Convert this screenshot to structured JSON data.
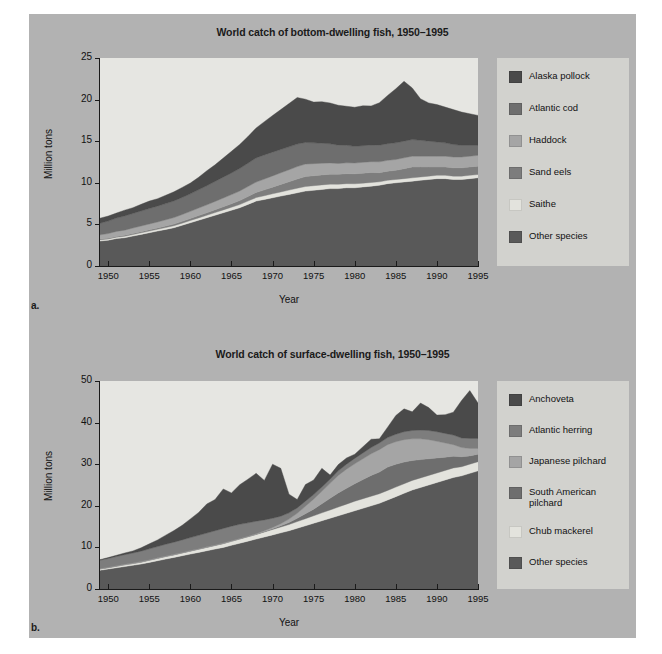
{
  "figure": {
    "background_color": "#b2b2b2",
    "page_color": "#ffffff",
    "plot_background_color": "#e6e6e2",
    "legend_background_color": "#d2d2ce"
  },
  "panels": [
    {
      "letter": "a.",
      "title": "World catch of bottom-dwelling fish, 1950–1995",
      "ylabel": "Million tons",
      "xlabel": "Year"
    },
    {
      "letter": "b.",
      "title": "World catch of surface-dwelling fish, 1950–1995",
      "ylabel": "Million tons",
      "xlabel": "Year"
    }
  ],
  "chart_data": [
    {
      "type": "area",
      "stacked": true,
      "title": "World catch of bottom-dwelling fish, 1950–1995",
      "xlabel": "Year",
      "ylabel": "Million tons",
      "xlim": [
        1949,
        1995
      ],
      "ylim": [
        0,
        25
      ],
      "yticks": [
        0,
        5,
        10,
        15,
        20,
        25
      ],
      "xticks": [
        1950,
        1955,
        1960,
        1965,
        1970,
        1975,
        1980,
        1985,
        1990,
        1995
      ],
      "grid": false,
      "legend_position": "right",
      "x": [
        1949,
        1950,
        1951,
        1952,
        1953,
        1954,
        1955,
        1956,
        1957,
        1958,
        1959,
        1960,
        1961,
        1962,
        1963,
        1964,
        1965,
        1966,
        1967,
        1968,
        1969,
        1970,
        1971,
        1972,
        1973,
        1974,
        1975,
        1976,
        1977,
        1978,
        1979,
        1980,
        1981,
        1982,
        1983,
        1984,
        1985,
        1986,
        1987,
        1988,
        1989,
        1990,
        1991,
        1992,
        1993,
        1994,
        1995
      ],
      "series": [
        {
          "name": "Other species",
          "color": "#595959",
          "values": [
            3.0,
            3.1,
            3.3,
            3.4,
            3.6,
            3.8,
            4.0,
            4.2,
            4.4,
            4.6,
            4.9,
            5.2,
            5.5,
            5.8,
            6.1,
            6.4,
            6.7,
            7.0,
            7.4,
            7.8,
            8.0,
            8.2,
            8.4,
            8.6,
            8.8,
            9.0,
            9.1,
            9.2,
            9.3,
            9.3,
            9.4,
            9.4,
            9.5,
            9.6,
            9.7,
            9.9,
            10.0,
            10.1,
            10.2,
            10.3,
            10.4,
            10.5,
            10.5,
            10.4,
            10.4,
            10.5,
            10.6
          ]
        },
        {
          "name": "Saithe",
          "color": "#e3e3dd",
          "values": [
            0.15,
            0.15,
            0.16,
            0.17,
            0.18,
            0.19,
            0.2,
            0.21,
            0.22,
            0.24,
            0.25,
            0.27,
            0.28,
            0.3,
            0.32,
            0.34,
            0.36,
            0.38,
            0.4,
            0.42,
            0.45,
            0.48,
            0.5,
            0.52,
            0.55,
            0.55,
            0.55,
            0.55,
            0.54,
            0.52,
            0.5,
            0.48,
            0.46,
            0.44,
            0.42,
            0.4,
            0.4,
            0.4,
            0.4,
            0.4,
            0.4,
            0.4,
            0.4,
            0.4,
            0.4,
            0.4,
            0.4
          ]
        },
        {
          "name": "Sand eels",
          "color": "#7d7d7d",
          "values": [
            0.1,
            0.1,
            0.1,
            0.12,
            0.13,
            0.14,
            0.15,
            0.16,
            0.18,
            0.2,
            0.22,
            0.25,
            0.28,
            0.3,
            0.34,
            0.38,
            0.42,
            0.48,
            0.55,
            0.62,
            0.7,
            0.8,
            0.9,
            1.0,
            1.1,
            1.2,
            1.2,
            1.2,
            1.2,
            1.2,
            1.2,
            1.2,
            1.2,
            1.2,
            1.1,
            1.1,
            1.1,
            1.2,
            1.3,
            1.2,
            1.1,
            1.0,
            1.0,
            1.0,
            1.0,
            1.0,
            1.0
          ]
        },
        {
          "name": "Haddock",
          "color": "#a5a5a5",
          "values": [
            0.5,
            0.55,
            0.6,
            0.62,
            0.65,
            0.68,
            0.7,
            0.72,
            0.75,
            0.78,
            0.82,
            0.85,
            0.9,
            0.95,
            1.0,
            1.05,
            1.1,
            1.15,
            1.2,
            1.25,
            1.3,
            1.35,
            1.4,
            1.45,
            1.5,
            1.5,
            1.45,
            1.4,
            1.35,
            1.3,
            1.3,
            1.3,
            1.3,
            1.3,
            1.3,
            1.3,
            1.3,
            1.3,
            1.3,
            1.3,
            1.3,
            1.3,
            1.3,
            1.3,
            1.3,
            1.3,
            1.3
          ]
        },
        {
          "name": "Atlantic cod",
          "color": "#6e6e6e",
          "values": [
            1.4,
            1.5,
            1.6,
            1.7,
            1.75,
            1.8,
            1.85,
            1.9,
            1.95,
            2.0,
            2.05,
            2.1,
            2.2,
            2.3,
            2.4,
            2.5,
            2.6,
            2.7,
            2.8,
            2.9,
            2.9,
            2.85,
            2.8,
            2.75,
            2.7,
            2.6,
            2.5,
            2.4,
            2.3,
            2.2,
            2.1,
            2.0,
            2.0,
            2.0,
            2.0,
            2.0,
            2.0,
            2.0,
            2.0,
            1.9,
            1.8,
            1.7,
            1.6,
            1.5,
            1.4,
            1.3,
            1.2
          ]
        },
        {
          "name": "Alaska pollock",
          "color": "#4a4a4a",
          "values": [
            0.6,
            0.6,
            0.6,
            0.7,
            0.7,
            0.8,
            0.9,
            0.9,
            1.0,
            1.1,
            1.2,
            1.3,
            1.5,
            1.8,
            2.0,
            2.3,
            2.6,
            2.9,
            3.2,
            3.6,
            4.0,
            4.4,
            4.8,
            5.2,
            5.6,
            5.2,
            4.9,
            5.0,
            4.9,
            4.8,
            4.7,
            4.7,
            4.8,
            4.7,
            5.1,
            5.8,
            6.5,
            7.2,
            6.2,
            5.0,
            4.6,
            4.5,
            4.3,
            4.2,
            4.0,
            3.8,
            3.6
          ]
        }
      ]
    },
    {
      "type": "area",
      "stacked": true,
      "title": "World catch of surface-dwelling fish, 1950–1995",
      "xlabel": "Year",
      "ylabel": "Million tons",
      "xlim": [
        1949,
        1995
      ],
      "ylim": [
        0,
        50
      ],
      "yticks": [
        0,
        10,
        20,
        30,
        40,
        50
      ],
      "xticks": [
        1950,
        1955,
        1960,
        1965,
        1970,
        1975,
        1980,
        1985,
        1990,
        1995
      ],
      "grid": false,
      "legend_position": "right",
      "x": [
        1949,
        1950,
        1951,
        1952,
        1953,
        1954,
        1955,
        1956,
        1957,
        1958,
        1959,
        1960,
        1961,
        1962,
        1963,
        1964,
        1965,
        1966,
        1967,
        1968,
        1969,
        1970,
        1971,
        1972,
        1973,
        1974,
        1975,
        1976,
        1977,
        1978,
        1979,
        1980,
        1981,
        1982,
        1983,
        1984,
        1985,
        1986,
        1987,
        1988,
        1989,
        1990,
        1991,
        1992,
        1993,
        1994,
        1995
      ],
      "series": [
        {
          "name": "Other species",
          "color": "#595959",
          "values": [
            4.5,
            4.8,
            5.1,
            5.4,
            5.7,
            6.0,
            6.4,
            6.8,
            7.2,
            7.6,
            8.0,
            8.4,
            8.8,
            9.2,
            9.6,
            10.0,
            10.5,
            11.0,
            11.5,
            12.0,
            12.5,
            13.0,
            13.5,
            14.0,
            14.6,
            15.2,
            15.8,
            16.4,
            17.0,
            17.6,
            18.2,
            18.8,
            19.4,
            20.0,
            20.6,
            21.4,
            22.2,
            23.0,
            23.8,
            24.4,
            25.0,
            25.6,
            26.2,
            26.8,
            27.2,
            27.8,
            28.4
          ]
        },
        {
          "name": "Chub mackerel",
          "color": "#e3e3dd",
          "values": [
            0.3,
            0.3,
            0.35,
            0.4,
            0.4,
            0.45,
            0.5,
            0.55,
            0.6,
            0.6,
            0.65,
            0.7,
            0.75,
            0.8,
            0.85,
            0.9,
            0.95,
            1.0,
            1.05,
            1.1,
            1.2,
            1.3,
            1.4,
            1.5,
            1.6,
            1.7,
            1.8,
            1.9,
            2.0,
            2.1,
            2.2,
            2.3,
            2.3,
            2.3,
            2.3,
            2.3,
            2.3,
            2.3,
            2.3,
            2.3,
            2.3,
            2.3,
            2.3,
            2.3,
            2.2,
            2.2,
            2.2
          ]
        },
        {
          "name": "South American pilchard",
          "color": "#6e6e6e",
          "values": [
            0.05,
            0.05,
            0.05,
            0.05,
            0.05,
            0.05,
            0.05,
            0.05,
            0.05,
            0.05,
            0.05,
            0.05,
            0.05,
            0.05,
            0.05,
            0.05,
            0.05,
            0.05,
            0.05,
            0.05,
            0.1,
            0.2,
            0.3,
            0.5,
            0.8,
            1.2,
            1.6,
            2.2,
            2.8,
            3.4,
            3.8,
            4.2,
            4.6,
            5.0,
            5.2,
            5.6,
            5.5,
            5.2,
            4.8,
            4.4,
            4.0,
            3.6,
            3.2,
            2.8,
            2.4,
            2.0,
            1.8
          ]
        },
        {
          "name": "Japanese pilchard",
          "color": "#a5a5a5",
          "values": [
            0.1,
            0.1,
            0.1,
            0.1,
            0.1,
            0.1,
            0.1,
            0.1,
            0.1,
            0.1,
            0.1,
            0.1,
            0.1,
            0.1,
            0.1,
            0.1,
            0.1,
            0.1,
            0.1,
            0.15,
            0.2,
            0.3,
            0.5,
            0.8,
            1.2,
            1.8,
            2.4,
            3.0,
            3.6,
            4.2,
            4.6,
            4.8,
            5.0,
            5.2,
            5.4,
            5.4,
            5.4,
            5.4,
            5.2,
            5.0,
            4.6,
            4.0,
            3.4,
            2.8,
            2.2,
            1.8,
            1.4
          ]
        },
        {
          "name": "Atlantic herring",
          "color": "#7d7d7d",
          "values": [
            2.0,
            2.1,
            2.2,
            2.3,
            2.4,
            2.5,
            2.6,
            2.7,
            2.8,
            2.9,
            3.0,
            3.1,
            3.2,
            3.3,
            3.4,
            3.5,
            3.5,
            3.4,
            3.2,
            3.0,
            2.6,
            2.2,
            1.8,
            1.5,
            1.3,
            1.2,
            1.1,
            1.0,
            1.0,
            1.1,
            1.2,
            1.3,
            1.4,
            1.5,
            1.6,
            1.7,
            1.8,
            1.9,
            2.0,
            2.1,
            2.2,
            2.3,
            2.3,
            2.3,
            2.3,
            2.4,
            2.4
          ]
        },
        {
          "name": "Anchoveta",
          "color": "#4a4a4a",
          "values": [
            0.1,
            0.2,
            0.3,
            0.4,
            0.5,
            0.8,
            1.2,
            1.6,
            2.2,
            2.8,
            3.5,
            4.5,
            5.5,
            7.0,
            7.5,
            9.5,
            8.0,
            9.5,
            10.5,
            11.5,
            9.5,
            13.0,
            11.5,
            4.5,
            2.0,
            4.0,
            3.5,
            4.5,
            1.0,
            1.5,
            1.5,
            1.0,
            1.5,
            2.0,
            1.0,
            2.5,
            4.5,
            5.5,
            4.5,
            6.5,
            5.5,
            4.0,
            4.5,
            5.5,
            9.0,
            11.5,
            8.5
          ]
        }
      ]
    }
  ],
  "legends": [
    {
      "items": [
        {
          "label": "Alaska pollock",
          "color": "#4a4a4a"
        },
        {
          "label": "Atlantic cod",
          "color": "#6e6e6e"
        },
        {
          "label": "Haddock",
          "color": "#a5a5a5"
        },
        {
          "label": "Sand eels",
          "color": "#7d7d7d"
        },
        {
          "label": "Saithe",
          "color": "#e3e3dd"
        },
        {
          "label": "Other species",
          "color": "#595959"
        }
      ]
    },
    {
      "items": [
        {
          "label": "Anchoveta",
          "color": "#4a4a4a"
        },
        {
          "label": "Atlantic herring",
          "color": "#7d7d7d"
        },
        {
          "label": "Japanese pilchard",
          "color": "#a5a5a5"
        },
        {
          "label": "South American\npilchard",
          "color": "#6e6e6e"
        },
        {
          "label": "Chub mackerel",
          "color": "#e3e3dd"
        },
        {
          "label": "Other species",
          "color": "#595959"
        }
      ]
    }
  ]
}
